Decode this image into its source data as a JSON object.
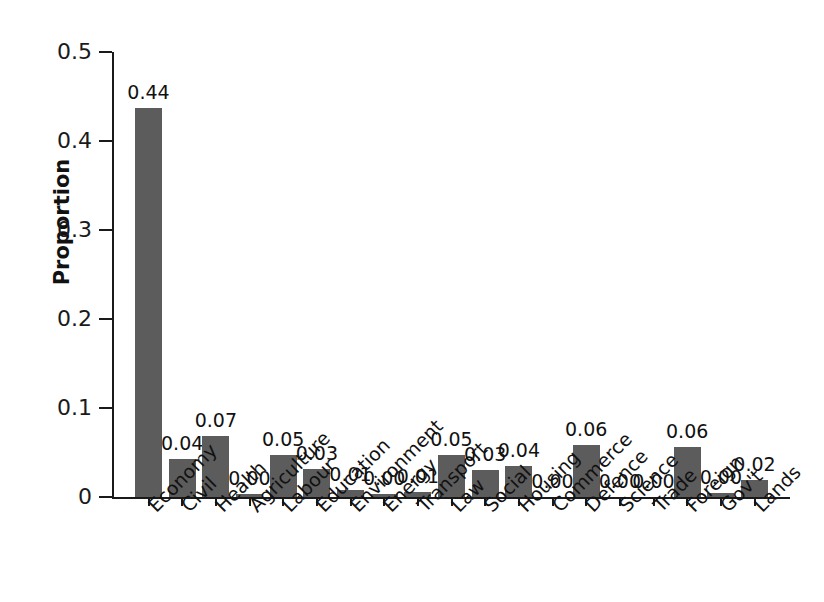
{
  "chart_data": {
    "type": "bar",
    "title": "",
    "xlabel": "",
    "ylabel": "Proportion",
    "ylim": [
      0,
      0.5
    ],
    "yticks": [
      0,
      0.1,
      0.2,
      0.3,
      0.4,
      0.5
    ],
    "ytick_labels": [
      "0",
      "0.1",
      "0.2",
      "0.3",
      "0.4",
      "0.5"
    ],
    "grid": false,
    "legend": false,
    "bar_color": "#5c5c5c",
    "background_color": "#ffffff",
    "xtick_rotation_deg": 45,
    "categories": [
      "Economy",
      "Civil",
      "Health",
      "Agriculture",
      "Labour",
      "Education",
      "Environment",
      "Energy",
      "Transport",
      "Law",
      "Social",
      "Housing",
      "Commerce",
      "Defence",
      "Science",
      "Trade",
      "Foreign",
      "Gov't",
      "Lands"
    ],
    "values": [
      0.437,
      0.043,
      0.069,
      0.003,
      0.047,
      0.032,
      0.008,
      0.003,
      0.006,
      0.047,
      0.03,
      0.035,
      0.0,
      0.059,
      0.0,
      0.0,
      0.056,
      0.004,
      0.019
    ],
    "data_labels": [
      "0.44",
      "0.04",
      "0.07",
      "0.00",
      "0.05",
      "0.03",
      "0.01",
      "0.00",
      "0.01",
      "0.05",
      "0.03",
      "0.04",
      "0.00",
      "0.06",
      "0.00",
      "0.00",
      "0.06",
      "0.00",
      "0.02"
    ]
  }
}
